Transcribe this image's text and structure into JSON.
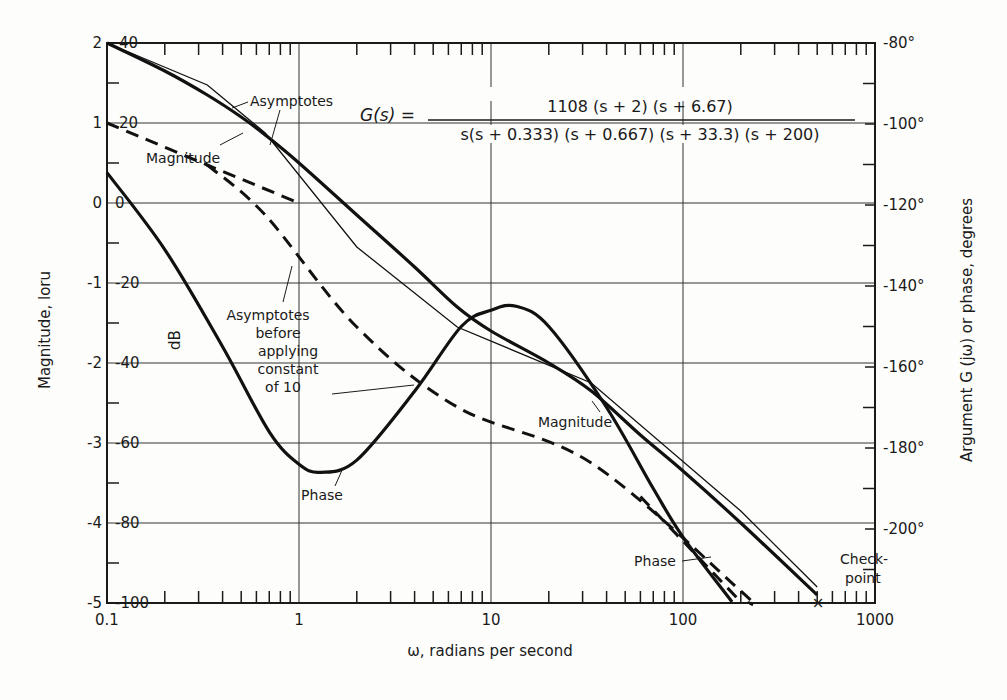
{
  "chart_data": {
    "type": "line",
    "title": "",
    "transfer_function": {
      "lhs": "G(s) =",
      "numerator": "1108 (s + 2) (s + 6.67)",
      "denominator": "s(s + 0.333) (s + 0.667) (s + 33.3) (s + 200)"
    },
    "xlabel": "ω, radians per second",
    "xscale": "log",
    "xlim": [
      0.1,
      1000
    ],
    "x_ticks": [
      "0.1",
      "1",
      "10",
      "100",
      "1000"
    ],
    "ylabel_left_outer": "Magnitude, loru",
    "ylabel_left_inner": "dB",
    "ylabel_right": "Argument G (jω) or phase, degrees",
    "ylim_db": [
      -100,
      40
    ],
    "ylim_phase": [
      -218,
      -80
    ],
    "left_ticks_loru": [
      "2",
      "1",
      "0",
      "-1",
      "-2",
      "-3",
      "-4",
      "-5"
    ],
    "left_ticks_db": [
      "40",
      "20",
      "0",
      "-20",
      "-40",
      "-60",
      "-80",
      "-100"
    ],
    "right_ticks": [
      "-80°",
      "-100°",
      "-120°",
      "-140°",
      "-160°",
      "-180°",
      "-200°"
    ],
    "grid": true,
    "series": [
      {
        "name": "Magnitude (exact)",
        "axis": "db",
        "style": "solid-heavy",
        "x": [
          0.1,
          0.2,
          0.333,
          0.5,
          0.667,
          1,
          2,
          4,
          6.67,
          10,
          20,
          33.3,
          60,
          100,
          200,
          500
        ],
        "y": [
          40,
          33,
          27,
          21.5,
          17,
          10,
          -3,
          -16,
          -26,
          -32,
          -40,
          -47,
          -58,
          -67,
          -80,
          -98
        ]
      },
      {
        "name": "Magnitude asymptotes",
        "axis": "db",
        "style": "solid-thin",
        "x": [
          0.1,
          0.333,
          0.667,
          2,
          6.67,
          33.3,
          200,
          500
        ],
        "y": [
          40,
          29.5,
          17.5,
          -11,
          -31,
          -45,
          -77,
          -96
        ]
      },
      {
        "name": "Asymptotes before applying constant of 10 (upper)",
        "axis": "db",
        "style": "dashed",
        "x": [
          0.1,
          0.333,
          1
        ],
        "y": [
          20,
          9.5,
          0
        ]
      },
      {
        "name": "Asymptotes before applying constant of 10",
        "axis": "db",
        "style": "dashed",
        "x": [
          0.333,
          0.667,
          2,
          6.67,
          33.3,
          200,
          220
        ],
        "y": [
          9.5,
          -3,
          -31,
          -51,
          -65,
          -97,
          -100
        ]
      },
      {
        "name": "Phase (exact)",
        "axis": "phase",
        "style": "solid-heavy",
        "x": [
          0.1,
          0.2,
          0.4,
          0.7,
          1,
          1.3,
          2,
          4,
          7,
          10,
          13.5,
          20,
          40,
          70,
          100,
          180
        ],
        "y": [
          -112,
          -131,
          -155,
          -176,
          -184,
          -186,
          -183,
          -166,
          -150,
          -146,
          -145,
          -150,
          -170,
          -190,
          -202,
          -218
        ]
      },
      {
        "name": "Phase asymptote",
        "axis": "phase",
        "style": "dashed",
        "x": [
          60,
          100,
          200
        ],
        "y": [
          -192,
          -203,
          -218
        ]
      }
    ],
    "annotations": [
      {
        "text": "Asymptotes"
      },
      {
        "text": "Magnitude"
      },
      {
        "text": "Asymptotes before applying constant of 10"
      },
      {
        "text": "Phase"
      },
      {
        "text": "Magnitude"
      },
      {
        "text": "Phase"
      },
      {
        "text": "Check-point"
      }
    ],
    "checkpoint": {
      "x": 500,
      "db": -100,
      "label": "Check-point"
    }
  },
  "labels": {
    "asymptotes": "Asymptotes",
    "magnitude": "Magnitude",
    "before1": "Asymptotes",
    "before2": "before",
    "before3": "applying",
    "before4": "constant",
    "before5": "of 10",
    "phase": "Phase",
    "check1": "Check-",
    "check2": "point",
    "checkmark": "×"
  }
}
